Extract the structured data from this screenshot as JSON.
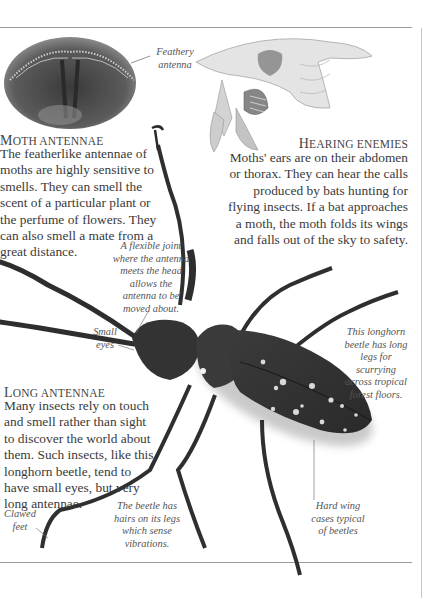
{
  "sections": {
    "moth_antennae": {
      "heading": "Moth antennae",
      "body": "The featherlike antennae of moths are highly sensitive to smells. They can smell the scent of a particular plant or the perfume of flowers. They can also smell a mate from a great distance."
    },
    "hearing_enemies": {
      "heading": "Hearing enemies",
      "body": "Moths' ears are on their abdomen or thorax. They can hear the calls produced by bats hunting for flying insects. If a bat approaches a moth, the moth folds its wings and falls out of the sky to safety."
    },
    "long_antennae": {
      "heading": "Long antennae",
      "body": "Many insects rely on touch and smell rather than sight to discover the world about them. Such insects, like this longhorn beetle, tend to have small eyes, but very long antennae."
    }
  },
  "captions": {
    "feathery_antenna": "Feathery antenna",
    "flexible_joint": "A flexible joint where the antenna meets the head allows the antenna to be moved about.",
    "small_eyes": "Small eyes",
    "long_legs": "This longhorn beetle has long legs for scurrying across tropical forest floors.",
    "hard_wing_cases": "Hard wing cases typical of beetles",
    "clawed_feet": "Clawed feet",
    "leg_hairs": "The beetle has hairs on its legs which sense vibrations."
  },
  "illustrations": {
    "moth_head": "moth-head-photo",
    "bat_and_moth": "bat-and-moth-drawing",
    "longhorn_beetle": "longhorn-beetle-photo"
  }
}
